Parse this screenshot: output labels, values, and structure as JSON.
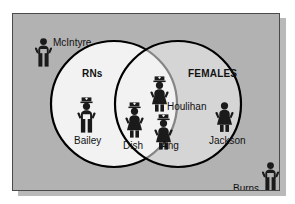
{
  "diagram": {
    "type": "venn-two-set",
    "sets": [
      {
        "id": "rns",
        "label": "RNs"
      },
      {
        "id": "females",
        "label": "FEMALES"
      }
    ],
    "members": [
      {
        "id": "mcintyre",
        "label": "McIntyre",
        "region": "outside",
        "icon": "male-figure-icon"
      },
      {
        "id": "burns",
        "label": "Burns",
        "region": "outside",
        "icon": "male-figure-icon"
      },
      {
        "id": "bailey",
        "label": "Bailey",
        "region": "rns-only",
        "icon": "male-nurse-figure-icon"
      },
      {
        "id": "houlihan",
        "label": "Houlihan",
        "region": "intersection",
        "icon": "female-nurse-figure-icon"
      },
      {
        "id": "dish",
        "label": "Dish",
        "region": "intersection",
        "icon": "female-nurse-figure-icon"
      },
      {
        "id": "ang",
        "label": "Ang",
        "region": "intersection",
        "icon": "female-nurse-figure-icon"
      },
      {
        "id": "jackson",
        "label": "Jackson",
        "region": "females-only",
        "icon": "female-figure-icon"
      }
    ],
    "colors": {
      "panel_background": "#b2b2b2",
      "circle_fill": "#f2f2f2",
      "circle_stroke": "#000000",
      "text": "#111111",
      "figure": "#1a1a1a"
    }
  }
}
